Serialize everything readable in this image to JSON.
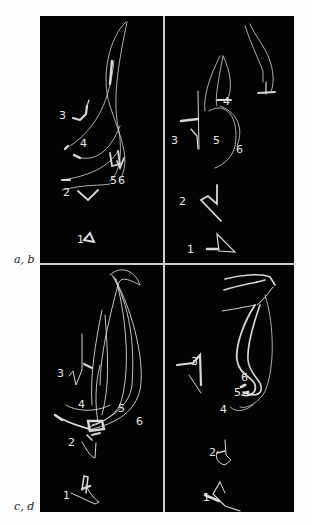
{
  "figure": {
    "panel_labels": {
      "top_pair": "a, b",
      "bottom_pair": "c, d"
    },
    "panels": [
      {
        "id": "a",
        "trace_labels": [
          "1",
          "2",
          "3",
          "4",
          "5",
          "6"
        ]
      },
      {
        "id": "b",
        "trace_labels": [
          "1",
          "2",
          "3",
          "4",
          "5",
          "6"
        ]
      },
      {
        "id": "c",
        "trace_labels": [
          "1",
          "2",
          "3",
          "4",
          "5",
          "6"
        ]
      },
      {
        "id": "d",
        "trace_labels": [
          "1",
          "2",
          "3",
          "4",
          "5",
          "6"
        ]
      }
    ],
    "colors": {
      "background": "#030303",
      "trace": "#d8d8d8",
      "page": "#fbfbfb"
    }
  }
}
